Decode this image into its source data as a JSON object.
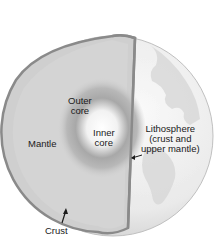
{
  "diagram": {
    "labels": {
      "outer_core": [
        "Outer",
        "core"
      ],
      "inner_core": [
        "Inner",
        "core"
      ],
      "mantle": "Mantle",
      "lithosphere": [
        "Lithosphere",
        "(crust and",
        "upper mantle)"
      ],
      "crust": "Crust"
    },
    "colors": {
      "background": "#ffffff",
      "globe_surface": "#ececec",
      "continents": "#d6d6d6",
      "cut_face": "#cfcfcf",
      "crust_edge": "#8a8a8a",
      "outer_core": "#9a9a9a",
      "inner_core": "#ffffff",
      "text": "#1a1a1a"
    }
  }
}
